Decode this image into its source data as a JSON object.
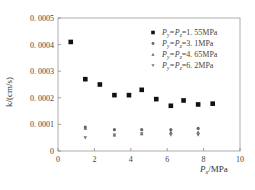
{
  "chart_data": {
    "type": "scatter",
    "title": "",
    "xlabel": "P_x/MPa",
    "ylabel": "k/(cm/s)",
    "xlim": [
      0,
      10
    ],
    "ylim": [
      0,
      0.0005
    ],
    "x_ticks": [
      "0",
      "2",
      "4",
      "6",
      "8",
      "10"
    ],
    "y_ticks": [
      "0",
      "0.0001",
      "0.0002",
      "0.0003",
      "0.0004",
      "0.0005"
    ],
    "grid": false,
    "legend_position": "upper right",
    "series": [
      {
        "name": "P_y=P_z=1.55MPa",
        "marker": "square",
        "color": "#111111",
        "x": [
          0.7,
          1.5,
          2.3,
          3.1,
          3.9,
          4.6,
          5.4,
          6.2,
          6.9,
          7.7,
          8.5
        ],
        "y": [
          0.00041,
          0.00027,
          0.00025,
          0.00021,
          0.00021,
          0.00023,
          0.000195,
          0.00017,
          0.00019,
          0.000175,
          0.000178
        ]
      },
      {
        "name": "P_y=P_z=3.1MPa",
        "marker": "circle",
        "color": "#666666",
        "x": [
          1.5,
          3.1,
          4.6,
          6.2,
          7.7
        ],
        "y": [
          9e-05,
          8e-05,
          8e-05,
          8e-05,
          8.5e-05
        ]
      },
      {
        "name": "P_y=P_z=4.65MPa",
        "marker": "triangle-up",
        "color": "#666666",
        "x": [
          1.5,
          3.1,
          4.6,
          6.2,
          7.7
        ],
        "y": [
          8.5e-05,
          6e-05,
          6.5e-05,
          7e-05,
          7e-05
        ]
      },
      {
        "name": "P_y=P_z=6.2MPa",
        "marker": "triangle-down",
        "color": "#777777",
        "x": [
          1.5,
          3.1,
          4.6,
          6.2,
          7.7
        ],
        "y": [
          5e-05,
          6e-05,
          6.5e-05,
          6e-05,
          6e-05
        ]
      }
    ]
  },
  "legend": {
    "items": [
      {
        "prefix": "P",
        "sub1": "y",
        "mid": "=P",
        "sub2": "z",
        "suffix": "=1. 55MPa"
      },
      {
        "prefix": "P",
        "sub1": "y",
        "mid": "=P",
        "sub2": "z",
        "suffix": "=3. 1MPa"
      },
      {
        "prefix": "P",
        "sub1": "y",
        "mid": "=P",
        "sub2": "z",
        "suffix": "=4. 65MPa"
      },
      {
        "prefix": "P",
        "sub1": "y",
        "mid": "=P",
        "sub2": "z",
        "suffix": "=6. 2MPa"
      }
    ]
  },
  "axes": {
    "x_label_main": "P",
    "x_label_sub": "x",
    "x_label_unit": "/MPa",
    "y_label": "k/(cm/s)",
    "y_tick_labels": [
      "0",
      "0. 0001",
      "0. 0002",
      "0. 0003",
      "0. 0004",
      "0. 0005"
    ],
    "x_tick_labels": [
      "0",
      "2",
      "4",
      "6",
      "8",
      "10"
    ]
  }
}
